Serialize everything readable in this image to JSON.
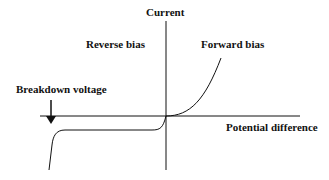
{
  "diagram": {
    "y_axis_label": "Current",
    "x_axis_label": "Potential difference",
    "regions": {
      "reverse": "Reverse bias",
      "forward": "Forward bias"
    },
    "annotation": "Breakdown voltage",
    "colors": {
      "line": "#111111",
      "background": "#ffffff"
    }
  }
}
